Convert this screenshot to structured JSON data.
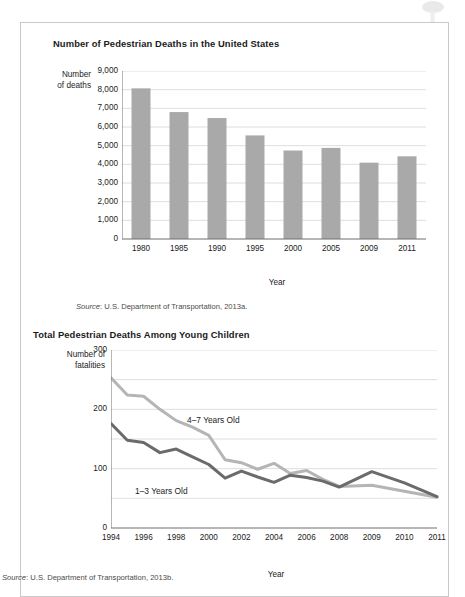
{
  "page": {
    "background": "#ffffff",
    "card_border": "#c9c9c9"
  },
  "figures": [
    {
      "id": "pedestrian-deaths-us",
      "title": "Number of Pedestrian Deaths in the United States",
      "source": "Source: U.S. Department of Transportation, 2013a.",
      "source_prefix": "Source",
      "source_rest": ": U.S. Department of Transportation, 2013a.",
      "y_axis_caption_line1": "Number",
      "y_axis_caption_line2": "of deaths",
      "x_axis_caption": "Year",
      "chart_data": {
        "type": "bar",
        "title": "Number of Pedestrian Deaths in the United States",
        "xlabel": "Year",
        "ylabel": "Number of deaths",
        "categories": [
          "1980",
          "1985",
          "1990",
          "1995",
          "2000",
          "2005",
          "2009",
          "2011"
        ],
        "values": [
          8070,
          6800,
          6480,
          5550,
          4740,
          4880,
          4090,
          4430
        ],
        "ylim": [
          0,
          9000
        ],
        "yticks": [
          0,
          1000,
          2000,
          3000,
          4000,
          5000,
          6000,
          7000,
          8000,
          9000
        ],
        "ytick_labels": [
          "0",
          "1,000",
          "2,000",
          "3,000",
          "4,000",
          "5,000",
          "6,000",
          "7,000",
          "8,000",
          "9,000"
        ],
        "grid": true,
        "legend": "none",
        "bar_color": "#a9a9a9",
        "grid_color": "#d6d6d6",
        "axis_color": "#6f6f6f"
      }
    },
    {
      "id": "pedestrian-deaths-young-children",
      "title": "Total Pedestrian Deaths Among Young Children",
      "source": "Source: U.S. Department of Transportation, 2013b.",
      "source_prefix": "Source",
      "source_rest": ": U.S. Department of Transportation, 2013b.",
      "y_axis_caption_line1": "Number of",
      "y_axis_caption_line2": "fatalities",
      "x_axis_caption": "Year",
      "chart_data": {
        "type": "line",
        "title": "Total Pedestrian Deaths Among Young Children",
        "xlabel": "Year",
        "ylabel": "Number of fatalities",
        "categories": [
          "1994",
          "1995",
          "1996",
          "1997",
          "1998",
          "1999",
          "2000",
          "2001",
          "2002",
          "2003",
          "2004",
          "2005",
          "2006",
          "2007",
          "2008",
          "2009",
          "2010",
          "2011"
        ],
        "tick_labels": [
          "1994",
          "1996",
          "1998",
          "2000",
          "2002",
          "2004",
          "2006",
          "2008",
          "2009",
          "2010",
          "2011"
        ],
        "ylim": [
          0,
          300
        ],
        "yticks": [
          0,
          50,
          100,
          150,
          200,
          250,
          300
        ],
        "ytick_labels": [
          "0",
          "",
          "100",
          "",
          "200",
          "",
          "300"
        ],
        "grid": true,
        "legend": "inline",
        "grid_color": "#d6d6d6",
        "axis_color": "#6f6f6f",
        "series": [
          {
            "name": "4–7 Years Old",
            "color": "#b5b5b5",
            "label_x": 166,
            "label_y": 392,
            "values": [
              253,
              224,
              222,
              200,
              181,
              170,
              156,
              115,
              110,
              99,
              109,
              92,
              97,
              82,
              70,
              72,
              62,
              52
            ]
          },
          {
            "name": "1–3 Years Old",
            "color": "#6b6b6b",
            "label_x": 114,
            "label_y": 463,
            "values": [
              176,
              148,
              144,
              127,
              133,
              120,
              107,
              84,
              96,
              86,
              77,
              89,
              85,
              79,
              69,
              95,
              76,
              53
            ]
          }
        ]
      }
    }
  ]
}
